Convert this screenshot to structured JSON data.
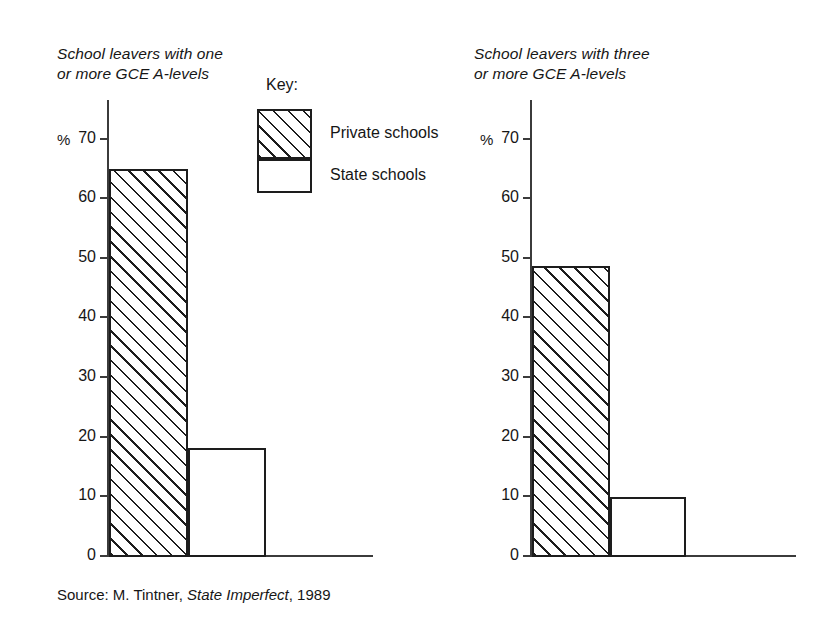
{
  "key": {
    "title": "Key:",
    "private_label": "Private schools",
    "state_label": "State schools"
  },
  "source": {
    "prefix": "Source: M. Tintner, ",
    "work": "State Imperfect",
    "suffix": ", 1989"
  },
  "axis": {
    "unit_label": "%",
    "ticks": [
      "70",
      "60",
      "50",
      "40",
      "30",
      "20",
      "10",
      "0"
    ]
  },
  "chart_data": [
    {
      "type": "bar",
      "title": "School leavers with one\nor more GCE A-levels",
      "categories": [
        "Private schools",
        "State schools"
      ],
      "values": [
        64.8,
        18.0
      ],
      "xlabel": "",
      "ylabel": "%",
      "ylim": [
        0,
        70
      ],
      "yticks": [
        0,
        10,
        20,
        30,
        40,
        50,
        60,
        70
      ],
      "grid": false,
      "legend_position": "top-center",
      "series": [
        {
          "name": "Private schools",
          "value": 64.8,
          "fill": "hatched"
        },
        {
          "name": "State schools",
          "value": 18.0,
          "fill": "white"
        }
      ]
    },
    {
      "type": "bar",
      "title": "School leavers with three\nor more GCE A-levels",
      "categories": [
        "Private schools",
        "State schools"
      ],
      "values": [
        48.5,
        9.8
      ],
      "xlabel": "",
      "ylabel": "%",
      "ylim": [
        0,
        70
      ],
      "yticks": [
        0,
        10,
        20,
        30,
        40,
        50,
        60,
        70
      ],
      "grid": false,
      "legend_position": "top-center",
      "series": [
        {
          "name": "Private schools",
          "value": 48.5,
          "fill": "hatched"
        },
        {
          "name": "State schools",
          "value": 9.8,
          "fill": "white"
        }
      ]
    }
  ],
  "colors": {
    "ink": "#1d1d1d",
    "axis": "#3b3b3b",
    "background": "#ffffff"
  }
}
